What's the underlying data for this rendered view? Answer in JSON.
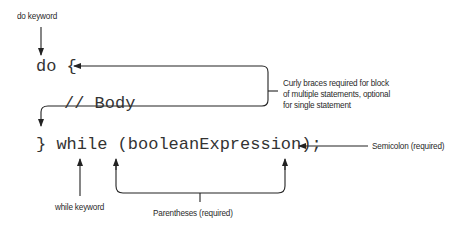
{
  "diagram": {
    "code_lines": [
      "do {",
      "// Body",
      "} while (booleanExpression);"
    ],
    "annotations": {
      "do_keyword": "do keyword",
      "curly_braces": [
        "Curly braces required for block",
        "of multiple statements, optional",
        "for single statement"
      ],
      "semicolon": "Semicolon (required)",
      "while_keyword": "while keyword",
      "parentheses": "Parentheses (required)"
    },
    "colors": {
      "line": "#222222",
      "code_text": "#333333",
      "label_text": "#2a2a2a",
      "background": "#ffffff"
    }
  }
}
